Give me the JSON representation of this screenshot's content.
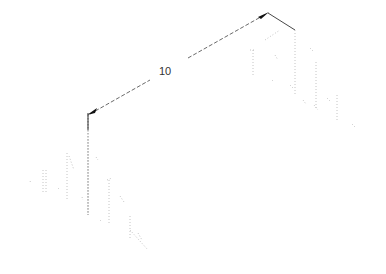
{
  "drawing": {
    "type": "isometric technical drawing",
    "dimension": {
      "label": "10",
      "label_position": {
        "x": 158,
        "y": 66
      },
      "start": {
        "x": 88,
        "y": 115
      },
      "end": {
        "x": 268,
        "y": 13
      },
      "color": "#222222"
    },
    "extension_lines": [
      {
        "from": {
          "x": 88,
          "y": 115
        },
        "to": {
          "x": 88,
          "y": 215
        }
      },
      {
        "from": {
          "x": 268,
          "y": 13
        },
        "to": {
          "x": 295,
          "y": 30
        }
      }
    ],
    "left_structure": {
      "description": "faint dotted wireframe (isometric steps/pillars)",
      "color": "#bbbbbb"
    },
    "right_structure": {
      "description": "faint dotted wireframe (isometric steps/pillars)",
      "color": "#bbbbbb"
    },
    "background": "#ffffff"
  }
}
